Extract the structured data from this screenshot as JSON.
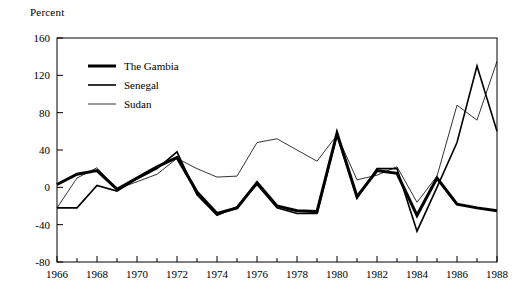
{
  "chart_data": {
    "type": "line",
    "title": "",
    "ylabel": "Percent",
    "xlabel": "",
    "ylim": [
      -80,
      160
    ],
    "xlim": [
      1966,
      1988
    ],
    "ytick_labels": [
      "160",
      "120",
      "80",
      "40",
      "0",
      "-40",
      "-80"
    ],
    "yticks": [
      160,
      120,
      80,
      40,
      0,
      -40,
      -80
    ],
    "xtick_labels": [
      "1966",
      "1968",
      "1970",
      "1972",
      "1974",
      "1976",
      "1978",
      "1980",
      "1982",
      "1984",
      "1986",
      "1988"
    ],
    "xticks": [
      1966,
      1968,
      1970,
      1972,
      1974,
      1976,
      1978,
      1980,
      1982,
      1984,
      1986,
      1988
    ],
    "minor_xticks": [
      1967,
      1969,
      1971,
      1973,
      1975,
      1977,
      1979,
      1981,
      1983,
      1985,
      1987
    ],
    "grid": false,
    "legend_position": "upper-left",
    "x": [
      1966,
      1967,
      1968,
      1969,
      1970,
      1971,
      1972,
      1973,
      1974,
      1975,
      1976,
      1977,
      1978,
      1979,
      1980,
      1981,
      1982,
      1983,
      1984,
      1985,
      1986,
      1987,
      1988
    ],
    "series": [
      {
        "name": "The Gambia",
        "color": "#000000",
        "width": "thick",
        "values": [
          3,
          14,
          18,
          -2,
          10,
          22,
          32,
          -5,
          -28,
          -22,
          5,
          -20,
          -25,
          -26,
          58,
          -10,
          18,
          15,
          -30,
          10,
          -18,
          -22,
          -25
        ]
      },
      {
        "name": "Senegal",
        "color": "#000000",
        "width": "medium",
        "values": [
          -22,
          -22,
          2,
          -4,
          9,
          20,
          38,
          -8,
          -30,
          -21,
          3,
          -22,
          -28,
          -28,
          56,
          -12,
          20,
          20,
          -47,
          0,
          48,
          130,
          60
        ]
      },
      {
        "name": "Sudan",
        "color": "#000000",
        "width": "thin",
        "values": [
          -22,
          10,
          21,
          -2,
          6,
          14,
          31,
          20,
          11,
          12,
          48,
          52,
          40,
          28,
          56,
          8,
          13,
          22,
          -16,
          12,
          88,
          72,
          135
        ]
      }
    ]
  },
  "legend": {
    "items": [
      {
        "label": "The Gambia"
      },
      {
        "label": "Senegal"
      },
      {
        "label": "Sudan"
      }
    ]
  }
}
